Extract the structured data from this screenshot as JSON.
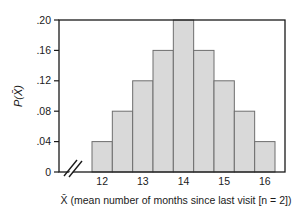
{
  "chart_data": {
    "type": "bar",
    "title": "",
    "subtitle": "",
    "xlabel": "X̄ (mean number of months since last visit [n = 2])",
    "ylabel": "P(X̄)",
    "categories": [
      "12",
      "12.5",
      "13",
      "13.5",
      "14",
      "14.5",
      "15",
      "15.5",
      "16"
    ],
    "values": [
      0.04,
      0.08,
      0.12,
      0.16,
      0.2,
      0.16,
      0.12,
      0.08,
      0.04
    ],
    "x": [
      12,
      12.5,
      13,
      13.5,
      14,
      14.5,
      15,
      15.5,
      16
    ],
    "xtick_labels": [
      "12",
      "13",
      "14",
      "15",
      "16"
    ],
    "xtick_values": [
      12,
      13,
      14,
      15,
      16
    ],
    "ytick_labels": [
      "0",
      ".04",
      ".08",
      ".12",
      ".16",
      ".20"
    ],
    "ytick_values": [
      0,
      0.04,
      0.08,
      0.12,
      0.16,
      0.2
    ],
    "ylim": [
      0,
      0.2
    ],
    "grid": false,
    "legend": false,
    "legend_position": "none",
    "axis_break": "x-axis break between origin and first bar",
    "annotations": []
  },
  "style": {
    "bar_fill": "#d9d9d9",
    "bar_stroke": "#6e6e6e",
    "frame_color": "#1a1a1a",
    "text_color": "#1a1a1a",
    "background": "#ffffff"
  },
  "axes": {
    "y_axis_title": "P(X̄)",
    "x_axis_title": "X̄ (mean number of months since last visit [n = 2])"
  }
}
